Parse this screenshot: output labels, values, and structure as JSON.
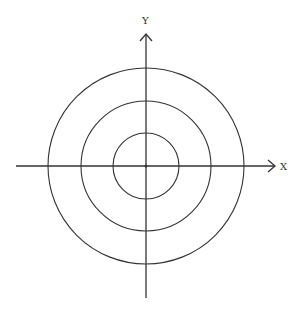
{
  "diagram": {
    "type": "concentric-circles-on-axes",
    "center": {
      "x": 146,
      "y": 166
    },
    "circles": [
      {
        "name": "inner",
        "radius": 33
      },
      {
        "name": "middle",
        "radius": 65
      },
      {
        "name": "outer",
        "radius": 98
      }
    ],
    "axes": {
      "x": {
        "label": "X",
        "start": 16,
        "end": 275
      },
      "y": {
        "label": "Y",
        "start": 298,
        "end": 34
      }
    },
    "colors": {
      "line": "#333333",
      "background": "#ffffff"
    }
  }
}
